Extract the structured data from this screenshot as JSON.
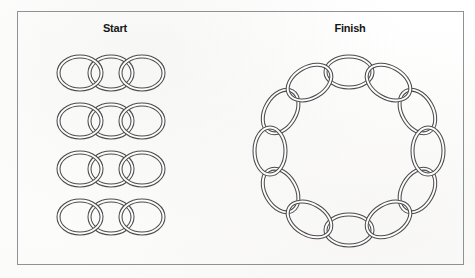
{
  "figure": {
    "type": "chain-link-puzzle-diagram",
    "frame": {
      "border_color": "#8e9196",
      "x": 17,
      "y": 11,
      "width": 447,
      "height": 254
    },
    "background_color": "#fefefe",
    "link_stroke_color": "#4c4c4e"
  },
  "labels": {
    "start": "Start",
    "finish": "Finish"
  },
  "start_side": {
    "description": "Four separate short chains, each made of three interlocking oval links",
    "row_count": 4,
    "links_per_row": 3,
    "total_links": 12,
    "rows": [
      {
        "index": 1,
        "center_y": 73,
        "link_centers_x": [
          80,
          111,
          142
        ]
      },
      {
        "index": 2,
        "center_y": 121,
        "link_centers_x": [
          80,
          111,
          142
        ]
      },
      {
        "index": 3,
        "center_y": 169,
        "link_centers_x": [
          80,
          111,
          142
        ]
      },
      {
        "index": 4,
        "center_y": 217,
        "link_centers_x": [
          80,
          111,
          142
        ]
      }
    ],
    "link_shape": {
      "kind": "oval",
      "rx": 23,
      "ry": 18
    }
  },
  "finish_side": {
    "description": "All twelve links joined into one closed circular chain",
    "total_links": 12,
    "circle": {
      "center_x": 349,
      "center_y": 151,
      "radius": 79
    },
    "link_shape": {
      "kind": "oval",
      "rx": 25,
      "ry": 17
    }
  }
}
